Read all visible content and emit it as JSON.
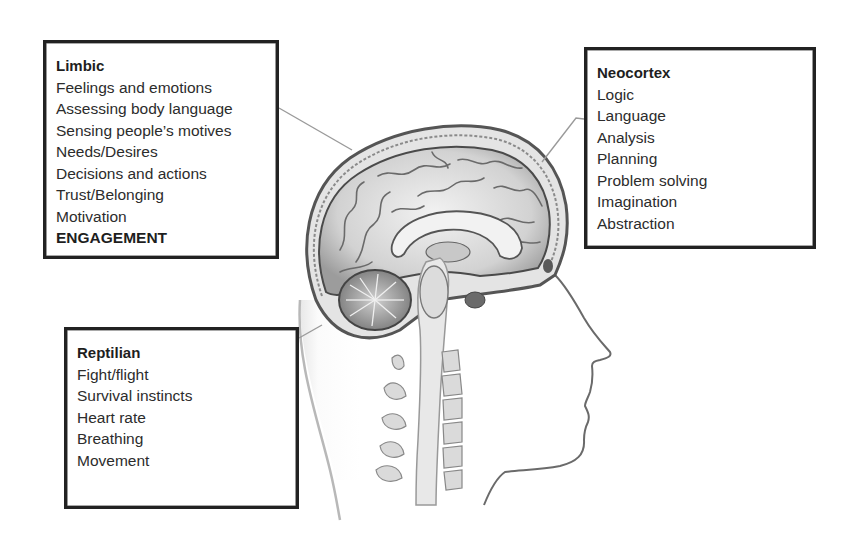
{
  "diagram": {
    "boxes": {
      "limbic": {
        "title": "Limbic",
        "items": [
          "Feelings and emotions",
          "Assessing body language",
          "Sensing people’s motives",
          "Needs/Desires",
          "Decisions and actions",
          "Trust/Belonging",
          "Motivation"
        ],
        "emphasis": "ENGAGEMENT"
      },
      "neocortex": {
        "title": "Neocortex",
        "items": [
          "Logic",
          "Language",
          "Analysis",
          "Planning",
          "Problem solving",
          "Imagination",
          "Abstraction"
        ]
      },
      "reptilian": {
        "title": "Reptilian",
        "items": [
          "Fight/flight",
          "Survival instincts",
          "Heart rate",
          "Breathing",
          "Movement"
        ]
      }
    },
    "connectors": [
      {
        "from": "limbic",
        "to": "limbic-region",
        "x1": 279,
        "y1": 108,
        "x2": 352,
        "y2": 150
      },
      {
        "from": "neocortex",
        "to": "cortex-region",
        "x1": 584,
        "y1": 119,
        "x2": 542,
        "y2": 162
      },
      {
        "from": "reptilian",
        "to": "brainstem-region",
        "x1": 299,
        "y1": 338,
        "x2": 322,
        "y2": 325
      }
    ],
    "colors": {
      "box_border": "#222222",
      "text": "#2c2c2c",
      "connector": "#9a9a9a",
      "illustration_ink": "#555555",
      "brain_fill": "#d6d6d6"
    }
  }
}
